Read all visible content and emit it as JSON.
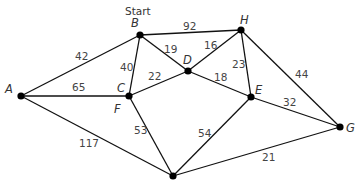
{
  "start_label": "Start",
  "nodes": [
    {
      "id": "A",
      "label": "A",
      "x": 21,
      "y": 96,
      "lx": 5,
      "ly": 93
    },
    {
      "id": "B",
      "label": "B",
      "x": 140,
      "y": 35,
      "lx": 131,
      "ly": 27
    },
    {
      "id": "C",
      "label": "C",
      "x": 129,
      "y": 96,
      "lx": 117,
      "ly": 92
    },
    {
      "id": "D",
      "label": "D",
      "x": 188,
      "y": 71,
      "lx": 183,
      "ly": 64
    },
    {
      "id": "H",
      "label": "H",
      "x": 241,
      "y": 30,
      "lx": 240,
      "ly": 24
    },
    {
      "id": "E",
      "label": "E",
      "x": 251,
      "y": 97,
      "lx": 255,
      "ly": 94
    },
    {
      "id": "G",
      "label": "G",
      "x": 340,
      "y": 127,
      "lx": 346,
      "ly": 132
    },
    {
      "id": "X",
      "label": "",
      "x": 173,
      "y": 176,
      "lx": 0,
      "ly": 0
    }
  ],
  "extra_labels": [
    {
      "text": "F",
      "x": 114,
      "y": 113
    }
  ],
  "edges": [
    {
      "from": "A",
      "to": "B",
      "weight": "42",
      "lx": 75,
      "ly": 60
    },
    {
      "from": "A",
      "to": "C",
      "weight": "65",
      "lx": 72,
      "ly": 91
    },
    {
      "from": "A",
      "to": "X",
      "weight": "117",
      "lx": 79,
      "ly": 147
    },
    {
      "from": "B",
      "to": "C",
      "weight": "40",
      "lx": 120,
      "ly": 71
    },
    {
      "from": "B",
      "to": "D",
      "weight": "19",
      "lx": 164,
      "ly": 53
    },
    {
      "from": "B",
      "to": "H",
      "weight": "92",
      "lx": 183,
      "ly": 30
    },
    {
      "from": "C",
      "to": "D",
      "weight": "22",
      "lx": 148,
      "ly": 80
    },
    {
      "from": "C",
      "to": "X",
      "weight": "53",
      "lx": 134,
      "ly": 134
    },
    {
      "from": "D",
      "to": "H",
      "weight": "16",
      "lx": 204,
      "ly": 49
    },
    {
      "from": "D",
      "to": "E",
      "weight": "18",
      "lx": 214,
      "ly": 81
    },
    {
      "from": "H",
      "to": "E",
      "weight": "23",
      "lx": 232,
      "ly": 68
    },
    {
      "from": "H",
      "to": "G",
      "weight": "44",
      "lx": 295,
      "ly": 78
    },
    {
      "from": "E",
      "to": "G",
      "weight": "32",
      "lx": 283,
      "ly": 106
    },
    {
      "from": "E",
      "to": "X",
      "weight": "54",
      "lx": 198,
      "ly": 137
    },
    {
      "from": "X",
      "to": "G",
      "weight": "21",
      "lx": 262,
      "ly": 161
    }
  ]
}
